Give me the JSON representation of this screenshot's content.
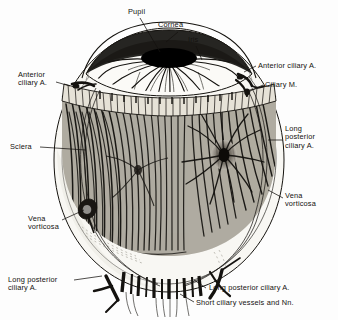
{
  "figure": {
    "type": "medical-line-engraving",
    "palette": {
      "paper": "#fdfdfd",
      "ink": "#14120f",
      "sclera": "#f7f6f2",
      "sclera_shadow": "#e2e0da",
      "choroid_dark": "#1a1814",
      "choroid_mid": "#6b665d",
      "ciliary_band": "#ded9cf",
      "pupil": "#000000"
    }
  },
  "labels": [
    {
      "id": "pupil",
      "text": "Pupil",
      "x": 128,
      "y": 8,
      "align": "left"
    },
    {
      "id": "cornea",
      "text": "Cornea",
      "x": 158,
      "y": 21,
      "align": "left"
    },
    {
      "id": "iris",
      "text": "Iris",
      "x": 188,
      "y": 36,
      "align": "left"
    },
    {
      "id": "anterior-ciliary-a-right",
      "text": "Anterior ciliary A.",
      "x": 258,
      "y": 63,
      "align": "left"
    },
    {
      "id": "ciliary-m",
      "text": "Ciliary M.",
      "x": 265,
      "y": 82,
      "align": "left"
    },
    {
      "id": "anterior-ciliary-a-left",
      "text": "Anterior\nciliary A.",
      "x": 18,
      "y": 72,
      "align": "left"
    },
    {
      "id": "sclera",
      "text": "Sclera",
      "x": 10,
      "y": 144,
      "align": "left"
    },
    {
      "id": "long-posterior-ciliary-a-right",
      "text": "Long\nposterior\nciliary A.",
      "x": 285,
      "y": 126,
      "align": "left"
    },
    {
      "id": "vena-vorticosa-right",
      "text": "Vena\nvorticosa",
      "x": 285,
      "y": 193,
      "align": "left"
    },
    {
      "id": "vena-vorticosa-left",
      "text": "Vena\nvorticosa",
      "x": 28,
      "y": 216,
      "align": "left"
    },
    {
      "id": "long-posterior-ciliary-a-left",
      "text": "Long posterior\nciliary A.",
      "x": 8,
      "y": 277,
      "align": "left"
    },
    {
      "id": "long-posterior-ciliary-a-bottom",
      "text": "Long posterior ciliary A.",
      "x": 208,
      "y": 285,
      "align": "left"
    },
    {
      "id": "short-ciliary-vessels",
      "text": "Short ciliary vessels and Nn.",
      "x": 196,
      "y": 300,
      "align": "left"
    }
  ],
  "structures": [
    {
      "id": "globe",
      "name": "eyeball-globe"
    },
    {
      "id": "cornea",
      "name": "cornea-dome"
    },
    {
      "id": "pupil",
      "name": "pupil-aperture"
    },
    {
      "id": "iris",
      "name": "iris-vascular-radials"
    },
    {
      "id": "ciliary",
      "name": "ciliary-muscle-band"
    },
    {
      "id": "choroid",
      "name": "choroid-vessel-field"
    },
    {
      "id": "vortex-left",
      "name": "vena-vorticosa-left-knob"
    },
    {
      "id": "vortex-right",
      "name": "vena-vorticosa-right-swirl"
    },
    {
      "id": "short-ciliary",
      "name": "short-ciliary-vessel-bundle"
    }
  ]
}
